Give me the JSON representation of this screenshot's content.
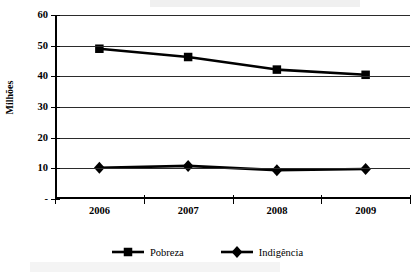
{
  "chart_data": {
    "type": "line",
    "title": "",
    "xlabel": "",
    "ylabel": "Milhões",
    "categories": [
      "2006",
      "2007",
      "2008",
      "2009"
    ],
    "ylim": [
      0,
      60
    ],
    "ytick_values": [
      0,
      10,
      20,
      30,
      40,
      50,
      60
    ],
    "ytick_labels": [
      "-",
      "10",
      "20",
      "30",
      "40",
      "50",
      "60"
    ],
    "grid": true,
    "legend_position": "bottom",
    "series": [
      {
        "name": "Pobreza",
        "marker": "square",
        "color": "#000000",
        "values": [
          49.0,
          46.3,
          42.2,
          40.5
        ]
      },
      {
        "name": "Indigência",
        "marker": "diamond",
        "color": "#000000",
        "values": [
          10.2,
          10.8,
          9.4,
          9.8
        ]
      }
    ]
  }
}
